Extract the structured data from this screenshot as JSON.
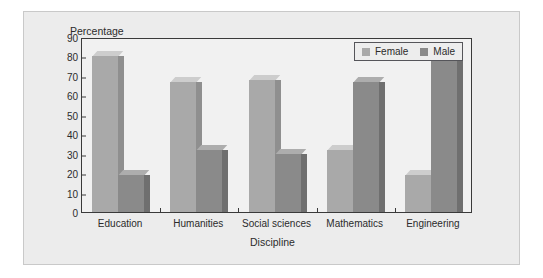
{
  "chart_data": {
    "type": "bar",
    "title": "",
    "ylabel": "Percentage",
    "xlabel": "Discipline",
    "categories": [
      "Education",
      "Humanities",
      "Social sciences",
      "Mathematics",
      "Engineering"
    ],
    "series": [
      {
        "name": "Female",
        "color": "#a9a9a9",
        "values": [
          80,
          67,
          68,
          32,
          19
        ]
      },
      {
        "name": "Male",
        "color": "#8a8a8a",
        "values": [
          19,
          32,
          30,
          67,
          80
        ]
      }
    ],
    "ylim": [
      0,
      90
    ],
    "ytick_labels": [
      "0",
      "10",
      "20",
      "30",
      "40",
      "50",
      "60",
      "70",
      "80",
      "90"
    ],
    "ytick_values": [
      0,
      10,
      20,
      30,
      40,
      50,
      60,
      70,
      80,
      90
    ],
    "grid": false,
    "legend_position": "top-right",
    "legend_entries": [
      "Female",
      "Male"
    ]
  }
}
